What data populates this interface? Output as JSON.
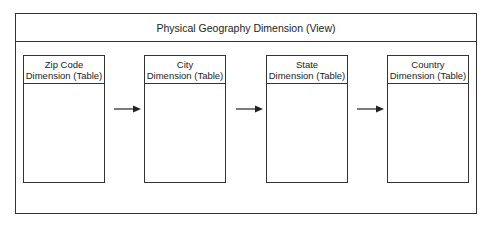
{
  "view": {
    "title": "Physical Geography Dimension (View)"
  },
  "tables": [
    {
      "line1": "Zip Code",
      "line2": "Dimension (Table)"
    },
    {
      "line1": "City",
      "line2": "Dimension (Table)"
    },
    {
      "line1": "State",
      "line2": "Dimension (Table)"
    },
    {
      "line1": "Country",
      "line2": "Dimension (Table)"
    }
  ],
  "arrows": [
    {
      "from": "Zip Code Dimension (Table)",
      "to": "City Dimension (Table)"
    },
    {
      "from": "City Dimension (Table)",
      "to": "State Dimension (Table)"
    },
    {
      "from": "State Dimension (Table)",
      "to": "Country Dimension (Table)"
    }
  ],
  "colors": {
    "stroke": "#333333",
    "background": "#ffffff"
  }
}
